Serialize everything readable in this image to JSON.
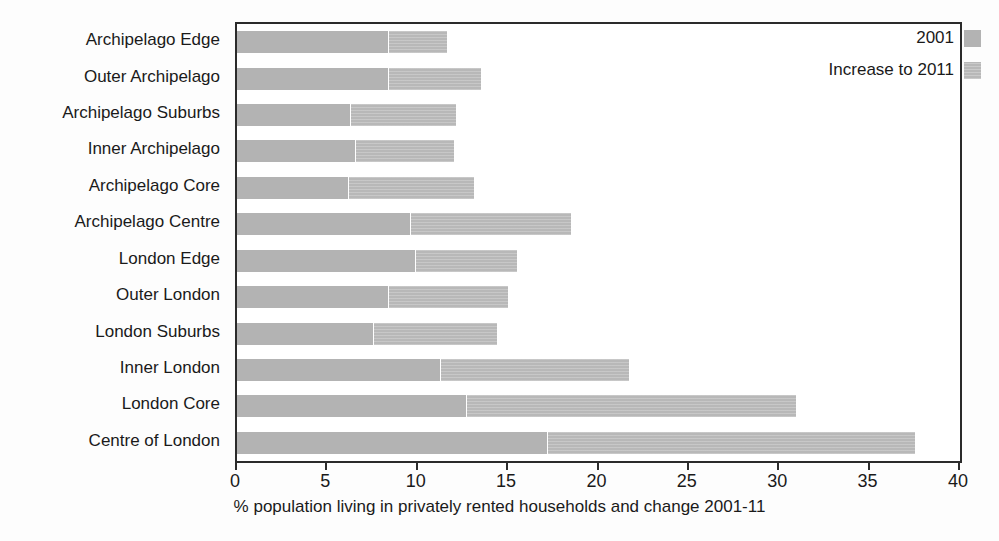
{
  "chart_data": {
    "type": "bar",
    "orientation": "horizontal",
    "stacked": true,
    "title": "",
    "xlabel": "% population living in privately rented households and change 2001-11",
    "ylabel": "",
    "xlim": [
      0,
      40
    ],
    "xticks": [
      0,
      5,
      10,
      15,
      20,
      25,
      30,
      35,
      40
    ],
    "xticklabels": [
      "0",
      "5",
      "10",
      "15",
      "20",
      "25",
      "30",
      "35",
      "40"
    ],
    "grid": false,
    "legend_position": "top-right",
    "categories": [
      "Archipelago Edge",
      "Outer Archipelago",
      "Archipelago Suburbs",
      "Inner Archipelago",
      "Archipelago Core",
      "Archipelago Centre",
      "London Edge",
      "Outer London",
      "London Suburbs",
      "Inner London",
      "London Core",
      "Centre of London"
    ],
    "series": [
      {
        "name": "2001",
        "color": "#b3b3b3",
        "values": [
          8.4,
          8.4,
          6.3,
          6.6,
          6.2,
          9.6,
          9.9,
          8.4,
          7.6,
          11.3,
          12.7,
          17.2
        ]
      },
      {
        "name": "Increase to 2011",
        "color": "#b8b8b8",
        "values": [
          3.2,
          5.1,
          5.8,
          5.4,
          6.9,
          8.9,
          5.6,
          6.6,
          6.8,
          10.4,
          18.2,
          20.3
        ]
      }
    ],
    "totals": [
      11.6,
      13.5,
      12.1,
      12.0,
      13.1,
      18.5,
      15.5,
      15.0,
      14.4,
      21.7,
      30.9,
      37.5
    ]
  },
  "legend": {
    "entries": [
      {
        "label": "2001",
        "swatch": "base"
      },
      {
        "label": "Increase to 2011",
        "swatch": "increase"
      }
    ]
  }
}
